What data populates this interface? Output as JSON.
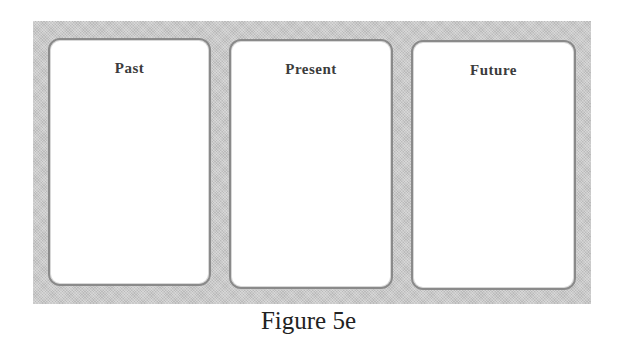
{
  "diagram": {
    "panel_color": "#c9c9c9",
    "card_border_color": "#8a8a8a",
    "cards": [
      {
        "label": "Past"
      },
      {
        "label": "Present"
      },
      {
        "label": "Future"
      }
    ]
  },
  "caption": "Figure 5e"
}
